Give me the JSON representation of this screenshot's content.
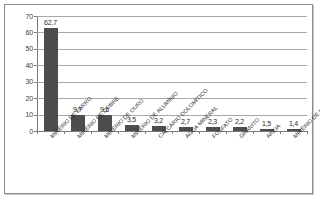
{
  "chart_data": {
    "type": "bar",
    "title": "",
    "subtitle": "",
    "xlabel": "",
    "ylabel": "",
    "ylim": [
      0,
      70
    ],
    "ytick_step": 10,
    "yticks": [
      "0",
      "10",
      "20",
      "30",
      "40",
      "50",
      "60",
      "70"
    ],
    "grid": true,
    "legend": false,
    "legend_position": "none",
    "decimal_separator": ",",
    "bar_color": "#4d4d4d",
    "categories": [
      "MINÉRIO DE FERRO",
      "MINÉRIO DE COBRE",
      "MINÉRIO DE OURO",
      "MINÉRIO DE ALUMÍNIO",
      "CALCÁRIO DOLOMÍTICO",
      "ÁGUA MINERAL",
      "FOSFATO",
      "GRANITO",
      "AREIA",
      "MINÉRIO DE MANGANÊS"
    ],
    "values": [
      62.7,
      9.7,
      9.6,
      3.5,
      3.2,
      2.7,
      2.3,
      2.2,
      1.5,
      1.4
    ],
    "value_labels": [
      "62,7",
      "9,7",
      "9,6",
      "3,5",
      "3,2",
      "2,7",
      "2,3",
      "2,2",
      "1,5",
      "1,4"
    ]
  },
  "colors": {
    "bar": "#4d4d4d",
    "gridline": "#a9a9a9",
    "axis": "#7a7a7a",
    "frame": "#8c8c8c",
    "text": "#2b2b2b",
    "background": "#ffffff"
  }
}
